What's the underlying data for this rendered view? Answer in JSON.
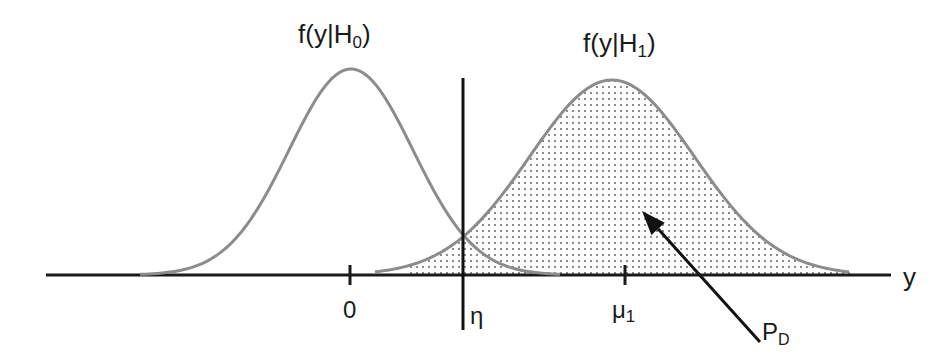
{
  "diagram": {
    "type": "hypothesis-testing-densities",
    "colors": {
      "axis": "#1a1a1a",
      "curve": "#8c8c8c",
      "threshold": "#111111",
      "dots": "#555555",
      "arrow": "#111111",
      "text": "#1a1a1a"
    },
    "axis": {
      "y_px": 275,
      "x_start_px": 46,
      "x_end_px": 891,
      "label": "y"
    },
    "curves": [
      {
        "name": "H0",
        "label": "f(y|H",
        "subscript": "0",
        "label_tail": ")",
        "mean_px": 351,
        "sigma_px": 62,
        "peak_px": 69,
        "x_from": 140,
        "x_to": 560
      },
      {
        "name": "H1",
        "label": "f(y|H",
        "subscript": "1",
        "label_tail": ")",
        "mean_px": 612,
        "sigma_px": 82.5,
        "peak_px": 80,
        "x_from": 375,
        "x_to": 850
      }
    ],
    "shaded_region": {
      "of_curve": "H1",
      "x_from": 410,
      "x_to": 850,
      "pattern": "dots"
    },
    "threshold": {
      "label": "η",
      "x_px": 463,
      "y_top_px": 78,
      "y_bottom_px": 330
    },
    "ticks": [
      {
        "label": "0",
        "x_px": 350
      },
      {
        "label": "μ",
        "subscript": "1",
        "x_px": 625
      }
    ],
    "annotation": {
      "label": "P",
      "subscript": "D",
      "arrow_tip": [
        642,
        211
      ],
      "arrow_tail": [
        760,
        342
      ]
    }
  }
}
